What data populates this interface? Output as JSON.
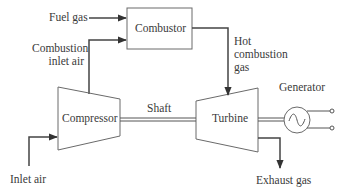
{
  "diagram": {
    "type": "gas turbine power generation schematic",
    "components": {
      "combustor": "Combustor",
      "compressor": "Compressor",
      "turbine": "Turbine",
      "generator": "Generator",
      "shaft": "Shaft"
    },
    "flows": {
      "fuel_gas": "Fuel gas",
      "combustion_inlet_air_line1": "Combustion",
      "combustion_inlet_air_line2": "inlet air",
      "hot_gas_line1": "Hot",
      "hot_gas_line2": "combustion",
      "hot_gas_line3": "gas",
      "inlet_air": "Inlet air",
      "exhaust_gas": "Exhaust gas"
    },
    "colors": {
      "line": "#5a5a5a",
      "arrow": "#333333",
      "text": "#3a3a3a",
      "background": "#ffffff"
    }
  }
}
